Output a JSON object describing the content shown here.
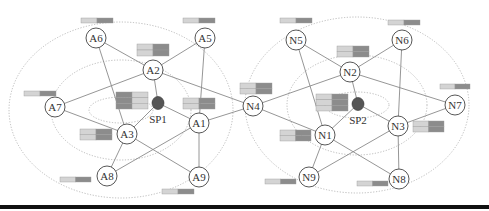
{
  "colors": {
    "edge": "#8a8a8a",
    "node_stroke": "#444444",
    "node_fill": "#ffffff",
    "sp_fill": "#555555",
    "ring": "#aaaaaa",
    "bar_light": "#d4d4d4",
    "bar_dark": "#8c8c8c",
    "bottom_rule": "#111111"
  },
  "clusters": [
    {
      "id": "cluster-1",
      "sp": "SP1",
      "cx": 121,
      "cy": 110,
      "rings": [
        {
          "rx": 112,
          "ry": 88
        },
        {
          "rx": 70,
          "ry": 50
        },
        {
          "rx": 32,
          "ry": 13
        }
      ]
    },
    {
      "id": "cluster-2",
      "sp": "SP2",
      "cx": 357,
      "cy": 105,
      "rings": [
        {
          "rx": 112,
          "ry": 88
        },
        {
          "rx": 70,
          "ry": 50
        },
        {
          "rx": 32,
          "ry": 13
        }
      ]
    }
  ],
  "supernodes": [
    {
      "id": "SP1",
      "label": "SP1",
      "x": 158,
      "y": 103
    },
    {
      "id": "SP2",
      "label": "SP2",
      "x": 358,
      "y": 104
    }
  ],
  "nodes": [
    {
      "id": "A1",
      "label": "A1",
      "x": 199,
      "y": 123
    },
    {
      "id": "A2",
      "label": "A2",
      "x": 153,
      "y": 70
    },
    {
      "id": "A3",
      "label": "A3",
      "x": 127,
      "y": 134
    },
    {
      "id": "A5",
      "label": "A5",
      "x": 205,
      "y": 38
    },
    {
      "id": "A6",
      "label": "A6",
      "x": 96,
      "y": 38
    },
    {
      "id": "A7",
      "label": "A7",
      "x": 55,
      "y": 107
    },
    {
      "id": "A8",
      "label": "A8",
      "x": 107,
      "y": 176
    },
    {
      "id": "A9",
      "label": "A9",
      "x": 199,
      "y": 177
    },
    {
      "id": "N1",
      "label": "N1",
      "x": 325,
      "y": 135
    },
    {
      "id": "N2",
      "label": "N2",
      "x": 350,
      "y": 72
    },
    {
      "id": "N3",
      "label": "N3",
      "x": 398,
      "y": 126
    },
    {
      "id": "N4",
      "label": "N4",
      "x": 253,
      "y": 106
    },
    {
      "id": "N5",
      "label": "N5",
      "x": 296,
      "y": 40
    },
    {
      "id": "N6",
      "label": "N6",
      "x": 402,
      "y": 40
    },
    {
      "id": "N7",
      "label": "N7",
      "x": 455,
      "y": 105
    },
    {
      "id": "N8",
      "label": "N8",
      "x": 399,
      "y": 179
    },
    {
      "id": "N9",
      "label": "N9",
      "x": 309,
      "y": 177
    }
  ],
  "edges": [
    [
      "A6",
      "A2"
    ],
    [
      "A6",
      "A3"
    ],
    [
      "A5",
      "A2"
    ],
    [
      "A5",
      "A1"
    ],
    [
      "A2",
      "A7"
    ],
    [
      "A2",
      "SP1"
    ],
    [
      "A2",
      "N4"
    ],
    [
      "A7",
      "A3"
    ],
    [
      "SP1",
      "A3"
    ],
    [
      "SP1",
      "A1"
    ],
    [
      "A3",
      "A8"
    ],
    [
      "A3",
      "A9"
    ],
    [
      "A1",
      "A8"
    ],
    [
      "A1",
      "A9"
    ],
    [
      "A1",
      "N4"
    ],
    [
      "N5",
      "N2"
    ],
    [
      "N5",
      "N1"
    ],
    [
      "N6",
      "N2"
    ],
    [
      "N6",
      "N3"
    ],
    [
      "N2",
      "N4"
    ],
    [
      "N2",
      "SP2"
    ],
    [
      "N2",
      "N7"
    ],
    [
      "N4",
      "N1"
    ],
    [
      "SP2",
      "N1"
    ],
    [
      "SP2",
      "N3"
    ],
    [
      "N3",
      "N7"
    ],
    [
      "N1",
      "N9"
    ],
    [
      "N1",
      "N8"
    ],
    [
      "N3",
      "N9"
    ],
    [
      "N3",
      "N8"
    ]
  ],
  "bars": [
    {
      "id": "bar-A6",
      "x": 81,
      "y": 18,
      "w": 32,
      "h": 5,
      "rows": 1,
      "split": 0.5
    },
    {
      "id": "bar-A5",
      "x": 183,
      "y": 18,
      "w": 32,
      "h": 5,
      "rows": 1,
      "split": 0.5
    },
    {
      "id": "bar-A2",
      "x": 137,
      "y": 44,
      "w": 32,
      "h": 12,
      "rows": 2,
      "split": 0.5
    },
    {
      "id": "bar-A7",
      "x": 24,
      "y": 91,
      "w": 32,
      "h": 5,
      "rows": 1,
      "split": 0.5
    },
    {
      "id": "bar-SP1",
      "x": 116,
      "y": 92,
      "w": 32,
      "h": 17,
      "rows": 3,
      "split": 0.5,
      "dark_first": true
    },
    {
      "id": "bar-A1",
      "x": 183,
      "y": 98,
      "w": 32,
      "h": 11,
      "rows": 2,
      "split": 0.5
    },
    {
      "id": "bar-A3",
      "x": 80,
      "y": 129,
      "w": 32,
      "h": 11,
      "rows": 2,
      "split": 0.5
    },
    {
      "id": "bar-A8",
      "x": 60,
      "y": 177,
      "w": 31,
      "h": 5,
      "rows": 1,
      "split": 0.5
    },
    {
      "id": "bar-A9",
      "x": 162,
      "y": 189,
      "w": 32,
      "h": 5,
      "rows": 1,
      "split": 0.5
    },
    {
      "id": "bar-N5",
      "x": 280,
      "y": 18,
      "w": 32,
      "h": 5,
      "rows": 1,
      "split": 0.5
    },
    {
      "id": "bar-N6",
      "x": 388,
      "y": 20,
      "w": 32,
      "h": 5,
      "rows": 1,
      "split": 0.5
    },
    {
      "id": "bar-N2",
      "x": 337,
      "y": 46,
      "w": 32,
      "h": 11,
      "rows": 2,
      "split": 0.5
    },
    {
      "id": "bar-N4",
      "x": 240,
      "y": 83,
      "w": 32,
      "h": 11,
      "rows": 2,
      "split": 0.5
    },
    {
      "id": "bar-SP2",
      "x": 316,
      "y": 94,
      "w": 32,
      "h": 17,
      "rows": 3,
      "split": 0.5
    },
    {
      "id": "bar-N7",
      "x": 440,
      "y": 84,
      "w": 30,
      "h": 5,
      "rows": 1,
      "split": 0.5
    },
    {
      "id": "bar-N1",
      "x": 280,
      "y": 130,
      "w": 31,
      "h": 11,
      "rows": 2,
      "split": 0.5
    },
    {
      "id": "bar-N3",
      "x": 413,
      "y": 121,
      "w": 31,
      "h": 11,
      "rows": 2,
      "split": 0.5
    },
    {
      "id": "bar-N9",
      "x": 265,
      "y": 179,
      "w": 31,
      "h": 5,
      "rows": 1,
      "split": 0.5
    },
    {
      "id": "bar-N8",
      "x": 357,
      "y": 181,
      "w": 31,
      "h": 5,
      "rows": 1,
      "split": 0.5
    }
  ]
}
